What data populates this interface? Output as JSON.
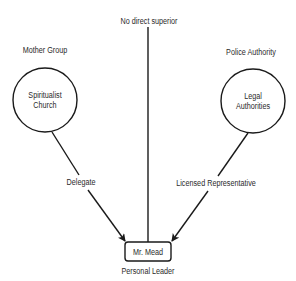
{
  "diagram": {
    "top_label": "No direct superior",
    "groups": [
      {
        "id": "mother-group",
        "heading": "Mother Group",
        "node_lines": [
          "Spiritualist",
          "Church"
        ]
      },
      {
        "id": "police-authority",
        "heading": "Police Authority",
        "node_lines": [
          "Legal",
          "Authorities"
        ]
      }
    ],
    "center_node": {
      "label": "Mr. Mead",
      "caption": "Personal Leader"
    },
    "edges": [
      {
        "from": "Spiritualist Church",
        "to": "Mr. Mead",
        "label": "Delegate"
      },
      {
        "from": "Legal Authorities",
        "to": "Mr. Mead",
        "label": "Licensed Representative"
      },
      {
        "from": "No direct superior",
        "to": "Mr. Mead",
        "label": ""
      }
    ],
    "colors": {
      "stroke": "#1a1a1a",
      "text": "#2a2a2a",
      "background": "#ffffff"
    }
  }
}
